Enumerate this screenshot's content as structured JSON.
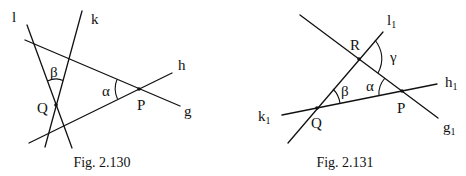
{
  "figures": [
    {
      "caption": "Fig. 2.130",
      "lines": {
        "l": {
          "label": "l",
          "x1": 27,
          "y1": 25,
          "x2": 72,
          "y2": 148
        },
        "k": {
          "label": "k",
          "x1": 82,
          "y1": 11,
          "x2": 45,
          "y2": 147
        },
        "g": {
          "label": "g",
          "x1": 25,
          "y1": 40,
          "x2": 180,
          "y2": 106
        },
        "h": {
          "label": "h",
          "x1": 29,
          "y1": 143,
          "x2": 172,
          "y2": 73
        }
      },
      "points": {
        "P": {
          "label": "P",
          "x": 139,
          "y": 89
        },
        "Q": {
          "label": "Q",
          "x": 56,
          "y": 105
        }
      },
      "angles": {
        "alpha": {
          "label": "α"
        },
        "beta": {
          "label": "β"
        }
      }
    },
    {
      "caption": "Fig. 2.131",
      "lines": {
        "g1": {
          "label": "g",
          "sub": "1",
          "x1": 300,
          "y1": 15,
          "x2": 438,
          "y2": 118
        },
        "l1": {
          "label": "l",
          "sub": "1",
          "x1": 383,
          "y1": 32,
          "x2": 288,
          "y2": 143
        },
        "h1": {
          "label": "h",
          "sub": "1",
          "x1": 437,
          "y1": 84,
          "x2": 282,
          "y2": 115
        }
      },
      "points": {
        "R": {
          "label": "R",
          "x": 359,
          "y": 59
        },
        "Q": {
          "label": "Q",
          "x": 317,
          "y": 108
        },
        "P": {
          "label": "P",
          "x": 402,
          "y": 91
        }
      },
      "angles": {
        "alpha": {
          "label": "α"
        },
        "beta": {
          "label": "β"
        },
        "gamma": {
          "label": "γ"
        }
      }
    }
  ]
}
